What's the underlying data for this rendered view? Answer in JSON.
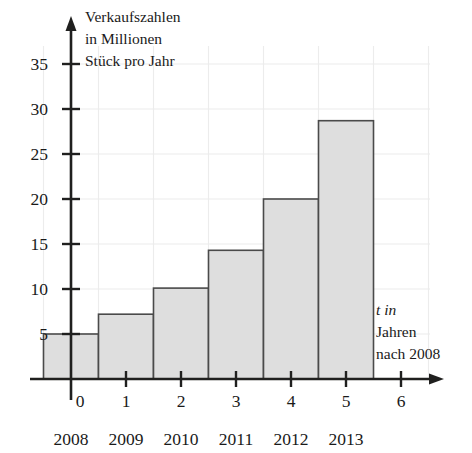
{
  "chart_data": {
    "type": "bar",
    "title": "",
    "ylabel": "Verkaufszahlen in Millionen Stück pro Jahr",
    "ylabel_lines": [
      "Verkaufszahlen",
      "in Millionen",
      "Stück pro Jahr"
    ],
    "xlabel": "t in Jahren nach 2008",
    "xlabel_lines": [
      "t in",
      "Jahren",
      "nach 2008"
    ],
    "xlabel_italic_token": "t",
    "categories": [
      "2008",
      "2009",
      "2010",
      "2011",
      "2012",
      "2013"
    ],
    "x": [
      0,
      1,
      2,
      3,
      4,
      5
    ],
    "values": [
      5.0,
      7.2,
      10.1,
      14.3,
      20.0,
      28.7
    ],
    "xtick_labels": [
      "0",
      "1",
      "2",
      "3",
      "4",
      "5",
      "6"
    ],
    "xtick_values": [
      0,
      1,
      2,
      3,
      4,
      5,
      6
    ],
    "ytick_labels": [
      "5",
      "10",
      "15",
      "20",
      "25",
      "30",
      "35"
    ],
    "ytick_values": [
      5,
      10,
      15,
      20,
      25,
      30,
      35
    ],
    "xlim": [
      -0.6,
      6.5
    ],
    "ylim": [
      0,
      37
    ],
    "grid": true,
    "legend": "none",
    "bar_width": 1.0,
    "colors": {
      "bar_fill": "#dedede",
      "bar_stroke": "#4a4a4a",
      "axis": "#20201f",
      "grid": "#ececec",
      "text": "#1a1a1a",
      "background": "#ffffff"
    }
  },
  "geometry": {
    "origin_x": 71,
    "baseline_y": 379,
    "px_per_x_unit": 55,
    "px_per_y_unit": 9.0
  }
}
